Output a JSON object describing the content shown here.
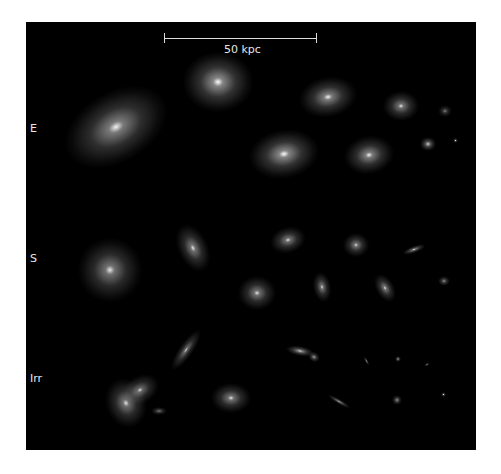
{
  "figure": {
    "scale_bar": {
      "label": "50 kpc"
    },
    "row_labels": {
      "elliptical": "E",
      "spiral": "S",
      "irregular": "Irr"
    },
    "colors": {
      "background": "#000000",
      "frame": "#ffffff",
      "text": "#e8e8e8"
    },
    "galaxies": {
      "elliptical": [
        {
          "x": 116,
          "y": 127,
          "w": 110,
          "h": 70,
          "rot": -30,
          "bright": 0.55
        },
        {
          "x": 218,
          "y": 82,
          "w": 70,
          "h": 60,
          "rot": 0,
          "bright": 0.6
        },
        {
          "x": 328,
          "y": 97,
          "w": 58,
          "h": 40,
          "rot": -10,
          "bright": 0.55
        },
        {
          "x": 401,
          "y": 106,
          "w": 36,
          "h": 30,
          "rot": 0,
          "bright": 0.5
        },
        {
          "x": 445,
          "y": 111,
          "w": 14,
          "h": 12,
          "rot": 0,
          "bright": 0.35
        },
        {
          "x": 284,
          "y": 154,
          "w": 70,
          "h": 48,
          "rot": -10,
          "bright": 0.6
        },
        {
          "x": 369,
          "y": 155,
          "w": 50,
          "h": 38,
          "rot": -10,
          "bright": 0.55
        },
        {
          "x": 428,
          "y": 144,
          "w": 16,
          "h": 14,
          "rot": 0,
          "bright": 0.6
        },
        {
          "x": 455,
          "y": 140,
          "w": 5,
          "h": 5,
          "rot": 0,
          "bright": 0.5
        }
      ],
      "spiral": [
        {
          "x": 110,
          "y": 270,
          "w": 64,
          "h": 64,
          "rot": 0,
          "bright": 0.5
        },
        {
          "x": 193,
          "y": 248,
          "w": 30,
          "h": 50,
          "rot": -25,
          "bright": 0.5
        },
        {
          "x": 288,
          "y": 240,
          "w": 36,
          "h": 26,
          "rot": -15,
          "bright": 0.5
        },
        {
          "x": 257,
          "y": 293,
          "w": 38,
          "h": 34,
          "rot": 0,
          "bright": 0.5
        },
        {
          "x": 356,
          "y": 245,
          "w": 26,
          "h": 24,
          "rot": 0,
          "bright": 0.5
        },
        {
          "x": 414,
          "y": 249,
          "w": 24,
          "h": 7,
          "rot": -20,
          "bright": 0.55
        },
        {
          "x": 322,
          "y": 287,
          "w": 18,
          "h": 30,
          "rot": -10,
          "bright": 0.5
        },
        {
          "x": 385,
          "y": 288,
          "w": 18,
          "h": 30,
          "rot": -30,
          "bright": 0.5
        },
        {
          "x": 444,
          "y": 281,
          "w": 12,
          "h": 10,
          "rot": 0,
          "bright": 0.45
        }
      ],
      "irregular": [
        {
          "x": 126,
          "y": 403,
          "w": 40,
          "h": 50,
          "rot": -20,
          "bright": 0.5
        },
        {
          "x": 140,
          "y": 390,
          "w": 40,
          "h": 28,
          "rot": -30,
          "bright": 0.45
        },
        {
          "x": 186,
          "y": 350,
          "w": 14,
          "h": 48,
          "rot": 35,
          "bright": 0.45
        },
        {
          "x": 159,
          "y": 411,
          "w": 16,
          "h": 8,
          "rot": 0,
          "bright": 0.4
        },
        {
          "x": 231,
          "y": 398,
          "w": 40,
          "h": 30,
          "rot": 0,
          "bright": 0.5
        },
        {
          "x": 300,
          "y": 351,
          "w": 28,
          "h": 10,
          "rot": 10,
          "bright": 0.6
        },
        {
          "x": 314,
          "y": 357,
          "w": 12,
          "h": 10,
          "rot": 30,
          "bright": 0.5
        },
        {
          "x": 366,
          "y": 361,
          "w": 3,
          "h": 10,
          "rot": -30,
          "bright": 0.5
        },
        {
          "x": 398,
          "y": 359,
          "w": 6,
          "h": 6,
          "rot": 0,
          "bright": 0.55
        },
        {
          "x": 427,
          "y": 364,
          "w": 6,
          "h": 3,
          "rot": -30,
          "bright": 0.45
        },
        {
          "x": 339,
          "y": 401,
          "w": 26,
          "h": 5,
          "rot": 30,
          "bright": 0.5
        },
        {
          "x": 397,
          "y": 400,
          "w": 10,
          "h": 10,
          "rot": 0,
          "bright": 0.5
        },
        {
          "x": 443,
          "y": 394,
          "w": 5,
          "h": 5,
          "rot": 0,
          "bright": 0.5
        }
      ]
    }
  }
}
